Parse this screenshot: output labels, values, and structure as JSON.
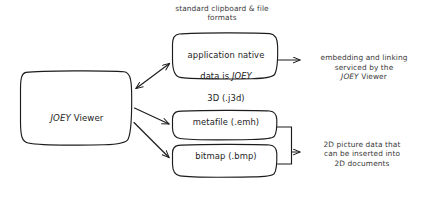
{
  "diagram": {
    "background_color": "#ffffff",
    "stroke_color": "#1c1c1c",
    "text_color": "#2b2b2b",
    "caption": {
      "clipboard_formats": "standard clipboard & file\nformats"
    },
    "nodes": {
      "viewer": {
        "label_prefix": "JOEY",
        "label_suffix": " Viewer",
        "shape": "rounded-rectangle"
      },
      "native": {
        "line1": "application native",
        "line2_prefix": "data is ",
        "line2_em": "JOEY",
        "line3": "3D (.j3d)",
        "shape": "rounded-rectangle"
      },
      "metafile": {
        "label": "metafile (.emh)",
        "shape": "rounded-rectangle"
      },
      "bitmap": {
        "label": "bitmap (.bmp)",
        "shape": "rounded-rectangle"
      }
    },
    "notes": {
      "embedding_prefix": "embedding and linking\nserviced by the\n",
      "embedding_em": "JOEY",
      "embedding_suffix": " Viewer",
      "two_d": "2D picture data that\ncan be inserted into\n2D documents"
    },
    "edges": [
      {
        "from": "viewer",
        "to": "native",
        "type": "double-arrow",
        "direction": "bidirectional"
      },
      {
        "from": "viewer",
        "to": "metafile",
        "type": "arrow",
        "direction": "right"
      },
      {
        "from": "viewer",
        "to": "bitmap",
        "type": "arrow",
        "direction": "right"
      },
      {
        "from": "native",
        "to": "embedding-note",
        "type": "arrow",
        "direction": "right"
      },
      {
        "from": "metafile-and-bitmap-bracket",
        "to": "two-d-note",
        "type": "arrow",
        "direction": "right"
      }
    ]
  }
}
